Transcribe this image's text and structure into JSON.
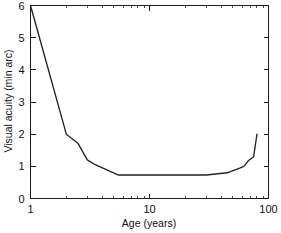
{
  "chart_data": {
    "type": "line",
    "title": "",
    "xlabel": "Age (years)",
    "ylabel": "Visual acuity (min arc)",
    "xscale": "log",
    "yscale": "linear",
    "xlim": [
      1,
      100
    ],
    "ylim": [
      0,
      6
    ],
    "grid": false,
    "legend": null,
    "xticks": [
      1,
      10,
      100
    ],
    "xticklabels": [
      "1",
      "10",
      "100"
    ],
    "yticks": [
      0,
      1,
      2,
      3,
      4,
      5,
      6
    ],
    "yticklabels": [
      "0",
      "1",
      "2",
      "3",
      "4",
      "5",
      "6"
    ],
    "series": [
      {
        "name": "Visual acuity vs age",
        "x": [
          1,
          2,
          2.5,
          3,
          3.5,
          5.5,
          30,
          45,
          58,
          62,
          68,
          75,
          80
        ],
        "values": [
          6.0,
          2.0,
          1.72,
          1.2,
          1.05,
          0.73,
          0.73,
          0.8,
          0.95,
          1.0,
          1.18,
          1.3,
          2.0
        ]
      }
    ]
  },
  "axes": {
    "x_label": "Age (years)",
    "y_label": "Visual acuity (min arc)",
    "x_tick_labels": [
      "1",
      "10",
      "100"
    ],
    "y_tick_labels": [
      "6",
      "5",
      "4",
      "3",
      "2",
      "1",
      "0"
    ]
  },
  "colors": {
    "line": "#222222",
    "axis": "#1a1a1a",
    "background": "#ffffff",
    "text": "#111111"
  }
}
